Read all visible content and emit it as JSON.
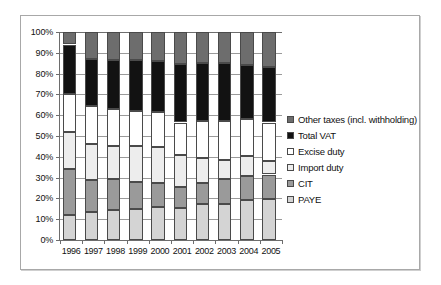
{
  "chart_data": {
    "type": "bar",
    "subtype": "100% stacked column",
    "title": "",
    "xlabel": "",
    "ylabel": "",
    "ylim": [
      0,
      100
    ],
    "ytick_labels": [
      "100%",
      "90%",
      "80%",
      "70%",
      "60%",
      "50%",
      "40%",
      "30%",
      "20%",
      "10%",
      "0%"
    ],
    "ytick_values": [
      100,
      90,
      80,
      70,
      60,
      50,
      40,
      30,
      20,
      10,
      0
    ],
    "grid": true,
    "legend_position": "right",
    "categories": [
      "1996",
      "1997",
      "1998",
      "1999",
      "2000",
      "2001",
      "2002",
      "2003",
      "2004",
      "2005"
    ],
    "series": [
      {
        "name": "PAYE",
        "color": "#d4d4d4",
        "values": [
          12,
          13.5,
          14.5,
          15,
          16,
          15.5,
          17.5,
          17.5,
          19,
          19.5
        ]
      },
      {
        "name": "CIT",
        "color": "#9a9a9a",
        "values": [
          22,
          15.5,
          15,
          13,
          11.5,
          10,
          10,
          12,
          12,
          12
        ]
      },
      {
        "name": "Import duty",
        "color": "#ededed",
        "values": [
          18,
          17,
          15.5,
          17,
          17,
          15.5,
          12,
          9,
          9.5,
          6.5
        ]
      },
      {
        "name": "Excise duty",
        "color": "#ffffff",
        "values": [
          18,
          18.5,
          18,
          17,
          17,
          15.5,
          17.5,
          18.5,
          17.5,
          18.5
        ]
      },
      {
        "name": "Total VAT",
        "color": "#121212",
        "values": [
          24,
          22.5,
          23.5,
          24.5,
          24.5,
          28,
          28,
          28,
          26,
          26.5
        ]
      },
      {
        "name": "Other taxes (incl. withholding)",
        "color": "#6d6d6d",
        "values": [
          6,
          13,
          13.5,
          13.5,
          14,
          15.5,
          15,
          15,
          16,
          17
        ]
      }
    ],
    "legend_entries": [
      {
        "label": "Other taxes (incl. withholding)",
        "color": "#6d6d6d"
      },
      {
        "label": "Total VAT",
        "color": "#121212"
      },
      {
        "label": "Excise duty",
        "color": "#ffffff"
      },
      {
        "label": "Import duty",
        "color": "#ededed"
      },
      {
        "label": "CIT",
        "color": "#9a9a9a"
      },
      {
        "label": "PAYE",
        "color": "#d4d4d4"
      }
    ]
  }
}
